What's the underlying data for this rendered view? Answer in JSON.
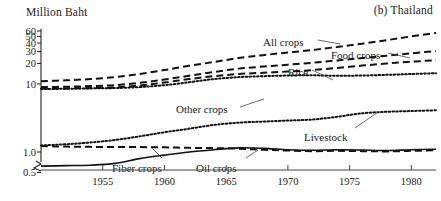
{
  "panel": {
    "title": "(b) Thailand"
  },
  "chart_data": {
    "type": "line",
    "title": "(b) Thailand",
    "xlabel": "",
    "ylabel": "Million Baht",
    "yscale": "log",
    "ylim": [
      0.5,
      60
    ],
    "xlim": [
      1950,
      1982
    ],
    "grid": false,
    "legend": "inline-annotations",
    "axis_break": true,
    "ytick_labels": [
      "60",
      "50",
      "40",
      "30",
      "20",
      "10",
      "1.0",
      "0.5"
    ],
    "ytick_values": [
      60,
      50,
      40,
      30,
      20,
      10,
      1.0,
      0.5
    ],
    "xtick_labels": [
      "1955",
      "1960",
      "1965",
      "1970",
      "1975",
      "1980"
    ],
    "xtick_values": [
      1955,
      1960,
      1965,
      1970,
      1975,
      1980
    ],
    "x": [
      1950,
      1952,
      1954,
      1956,
      1958,
      1960,
      1962,
      1964,
      1966,
      1968,
      1970,
      1972,
      1974,
      1976,
      1978,
      1980,
      1982
    ],
    "series": [
      {
        "name": "All crops",
        "style": "dashed",
        "values": [
          11.0,
          11.3,
          11.8,
          12.6,
          14.0,
          16.0,
          18.5,
          21.0,
          24.0,
          26.5,
          29.0,
          31.5,
          35.0,
          39.0,
          44.0,
          50.0,
          56.0
        ]
      },
      {
        "name": "Food crops",
        "style": "dashed",
        "values": [
          9.0,
          9.1,
          9.3,
          9.6,
          10.4,
          11.6,
          13.2,
          15.0,
          16.8,
          18.0,
          19.2,
          20.5,
          22.2,
          24.0,
          26.0,
          28.2,
          30.5
        ]
      },
      {
        "name": "Rice",
        "style": "dashed",
        "values": [
          8.6,
          8.6,
          8.7,
          8.9,
          9.5,
          10.5,
          11.8,
          13.0,
          14.0,
          14.6,
          15.2,
          16.0,
          17.2,
          18.6,
          20.0,
          21.2,
          22.4
        ]
      },
      {
        "name": "Other crops",
        "style": "dotted",
        "values": [
          8.4,
          8.5,
          8.6,
          8.7,
          9.0,
          9.6,
          10.6,
          11.8,
          12.6,
          13.0,
          13.3,
          13.4,
          13.2,
          13.3,
          13.6,
          14.0,
          14.4
        ]
      },
      {
        "name": "Livestock",
        "style": "dotted",
        "values": [
          1.25,
          1.3,
          1.38,
          1.5,
          1.7,
          1.95,
          2.2,
          2.5,
          2.7,
          2.8,
          2.9,
          3.0,
          3.3,
          3.7,
          3.9,
          4.0,
          4.1
        ]
      },
      {
        "name": "Oil crops",
        "style": "solid",
        "values": [
          0.62,
          0.63,
          0.64,
          0.68,
          0.8,
          0.9,
          1.0,
          1.08,
          1.15,
          1.13,
          1.08,
          1.06,
          1.08,
          1.07,
          1.05,
          1.08,
          1.1
        ]
      },
      {
        "name": "Fiber crops",
        "style": "dashed",
        "values": [
          1.22,
          1.2,
          1.19,
          1.18,
          1.18,
          1.17,
          1.15,
          1.14,
          1.12,
          1.08,
          1.05,
          1.03,
          1.04,
          1.03,
          1.02,
          1.04,
          1.06
        ]
      }
    ],
    "annotations": [
      {
        "text": "All crops",
        "x": 263,
        "y": 36
      },
      {
        "text": "Food crops",
        "x": 331,
        "y": 49
      },
      {
        "text": "Rice",
        "x": 288,
        "y": 66
      },
      {
        "text": "Other crops",
        "x": 176,
        "y": 103
      },
      {
        "text": "Livestock",
        "x": 304,
        "y": 131
      },
      {
        "text": "Fiber crops",
        "x": 112,
        "y": 162
      },
      {
        "text": "Oil crops",
        "x": 196,
        "y": 162
      }
    ]
  }
}
